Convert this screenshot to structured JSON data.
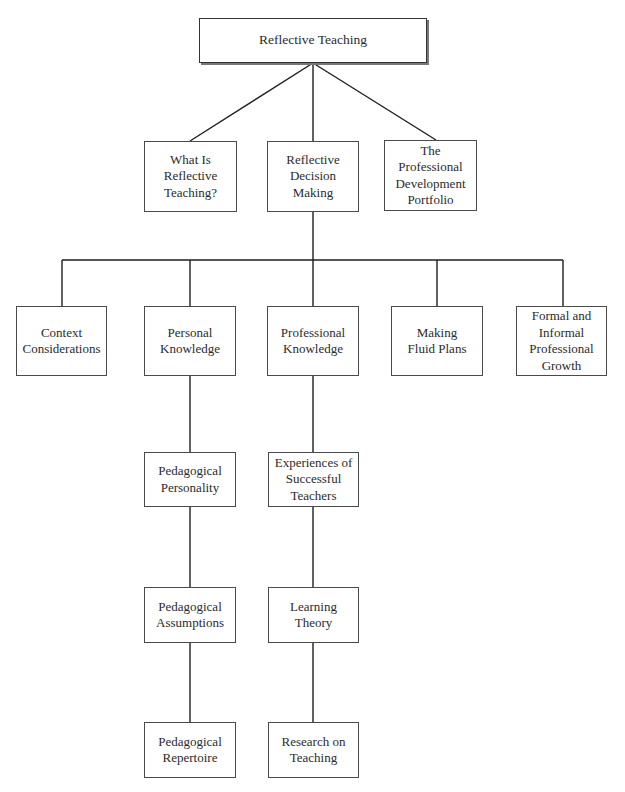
{
  "diagram": {
    "root": {
      "id": "root",
      "label": "Reflective Teaching",
      "box": [
        199,
        18,
        228,
        45
      ]
    },
    "nodes": [
      {
        "id": "what-is",
        "label": "What Is\nReflective\nTeaching?",
        "box": [
          144,
          141,
          93,
          71
        ]
      },
      {
        "id": "decision",
        "label": "Reflective\nDecision\nMaking",
        "box": [
          267,
          141,
          92,
          71
        ]
      },
      {
        "id": "portfolio",
        "label": "The\nProfessional\nDevelopment\nPortfolio",
        "box": [
          384,
          140,
          93,
          71
        ]
      },
      {
        "id": "context",
        "label": "Context\nConsiderations",
        "box": [
          16,
          306,
          91,
          70
        ]
      },
      {
        "id": "personal",
        "label": "Personal\nKnowledge",
        "box": [
          144,
          306,
          92,
          70
        ]
      },
      {
        "id": "professional",
        "label": "Professional\nKnowledge",
        "box": [
          267,
          306,
          92,
          70
        ]
      },
      {
        "id": "fluid",
        "label": "Making\nFluid Plans",
        "box": [
          391,
          306,
          92,
          70
        ]
      },
      {
        "id": "growth",
        "label": "Formal and\nInformal\nProfessional\nGrowth",
        "box": [
          516,
          306,
          91,
          70
        ]
      },
      {
        "id": "ped-personality",
        "label": "Pedagogical\nPersonality",
        "box": [
          144,
          452,
          92,
          55
        ]
      },
      {
        "id": "experiences",
        "label": "Experiences of\nSuccessful\nTeachers",
        "box": [
          268,
          452,
          91,
          55
        ]
      },
      {
        "id": "ped-assumptions",
        "label": "Pedagogical\nAssumptions",
        "box": [
          144,
          587,
          92,
          56
        ]
      },
      {
        "id": "learning-theory",
        "label": "Learning\nTheory",
        "box": [
          268,
          587,
          91,
          56
        ]
      },
      {
        "id": "ped-repertoire",
        "label": "Pedagogical\nRepertoire",
        "box": [
          144,
          722,
          92,
          56
        ]
      },
      {
        "id": "research",
        "label": "Research on\nTeaching",
        "box": [
          268,
          722,
          91,
          56
        ]
      }
    ],
    "edges": [
      [
        "root",
        "what-is"
      ],
      [
        "root",
        "decision"
      ],
      [
        "root",
        "portfolio"
      ],
      [
        "decision",
        "context"
      ],
      [
        "decision",
        "personal"
      ],
      [
        "decision",
        "professional"
      ],
      [
        "decision",
        "fluid"
      ],
      [
        "decision",
        "growth"
      ],
      [
        "personal",
        "ped-personality"
      ],
      [
        "ped-personality",
        "ped-assumptions"
      ],
      [
        "ped-assumptions",
        "ped-repertoire"
      ],
      [
        "professional",
        "experiences"
      ],
      [
        "experiences",
        "learning-theory"
      ],
      [
        "learning-theory",
        "research"
      ]
    ],
    "line_color": "#1e1e1e",
    "border_color": "#4a4a4a"
  }
}
